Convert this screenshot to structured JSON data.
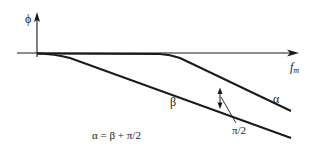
{
  "diagram": {
    "type": "phase-vs-modulation-frequency plot",
    "y_axis": {
      "label": "ϕ"
    },
    "x_axis": {
      "label_main": "f",
      "label_sub": "m"
    },
    "curves": [
      {
        "name": "alpha",
        "label": "α"
      },
      {
        "name": "beta",
        "label": "β"
      }
    ],
    "annotations": {
      "phase_difference": "π/2",
      "equation": "α = β + π/2"
    },
    "colors": {
      "line": "#1a1a1a",
      "background": "#ffffff"
    }
  }
}
